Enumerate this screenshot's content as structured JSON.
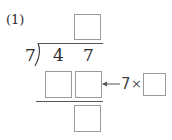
{
  "problem": {
    "number_label": "(1)",
    "divisor": "7",
    "dividend_digits": [
      "4",
      "7"
    ],
    "quotient_box": "",
    "product_boxes": [
      "",
      ""
    ],
    "remainder_box": "",
    "annotation": {
      "arrow": "←",
      "multiplier": "7",
      "times_sign": "×",
      "answer_box": ""
    }
  }
}
